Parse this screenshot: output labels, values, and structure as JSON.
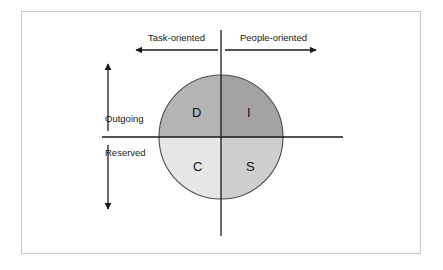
{
  "diagram": {
    "frame": {
      "border_color": "#c9c9c9",
      "background": "#ffffff"
    },
    "axes": {
      "horizontal": {
        "label_left": "Task-oriented",
        "label_right": "People-oriented",
        "color": "#1a1a1a"
      },
      "vertical": {
        "label_top": "Outgoing",
        "label_bottom": "Reserved",
        "color": "#1a1a1a"
      }
    },
    "arrows": {
      "left_arrow_name": "task-oriented-arrow",
      "right_arrow_name": "people-oriented-arrow",
      "up_arrow_name": "outgoing-arrow",
      "down_arrow_name": "reserved-arrow",
      "color": "#1a1a1a"
    },
    "circle": {
      "center_x": 221,
      "center_y": 137,
      "radius": 62,
      "outline_color": "#4a4a4a"
    },
    "quadrants": [
      {
        "id": "D",
        "letter": "D",
        "position": "top-left",
        "fill": "#b4b4b4",
        "meaning_axes": "Outgoing / Task-oriented"
      },
      {
        "id": "I",
        "letter": "I",
        "position": "top-right",
        "fill": "#a3a3a3",
        "meaning_axes": "Outgoing / People-oriented"
      },
      {
        "id": "C",
        "letter": "C",
        "position": "bottom-left",
        "fill": "#e6e6e6",
        "meaning_axes": "Reserved / Task-oriented"
      },
      {
        "id": "S",
        "letter": "S",
        "position": "bottom-right",
        "fill": "#cfcfcf",
        "meaning_axes": "Reserved / People-oriented"
      }
    ]
  }
}
